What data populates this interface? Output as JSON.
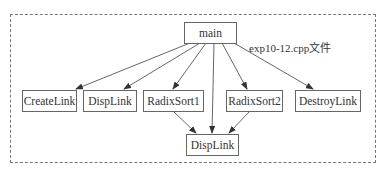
{
  "diagram": {
    "type": "call-graph",
    "file_label": "exp10-12.cpp文件",
    "nodes": [
      {
        "id": "main",
        "label": "main"
      },
      {
        "id": "createlink",
        "label": "CreateLink"
      },
      {
        "id": "displink_top",
        "label": "DispLink"
      },
      {
        "id": "radixsort1",
        "label": "RadixSort1"
      },
      {
        "id": "radixsort2",
        "label": "RadixSort2"
      },
      {
        "id": "destroylink",
        "label": "DestroyLink"
      },
      {
        "id": "displink_bottom",
        "label": "DispLink"
      }
    ],
    "edges": [
      {
        "from": "main",
        "to": "createlink"
      },
      {
        "from": "main",
        "to": "displink_top"
      },
      {
        "from": "main",
        "to": "radixsort1"
      },
      {
        "from": "main",
        "to": "displink_bottom"
      },
      {
        "from": "main",
        "to": "radixsort2"
      },
      {
        "from": "main",
        "to": "destroylink"
      },
      {
        "from": "radixsort1",
        "to": "displink_bottom"
      },
      {
        "from": "radixsort2",
        "to": "displink_bottom"
      }
    ]
  }
}
